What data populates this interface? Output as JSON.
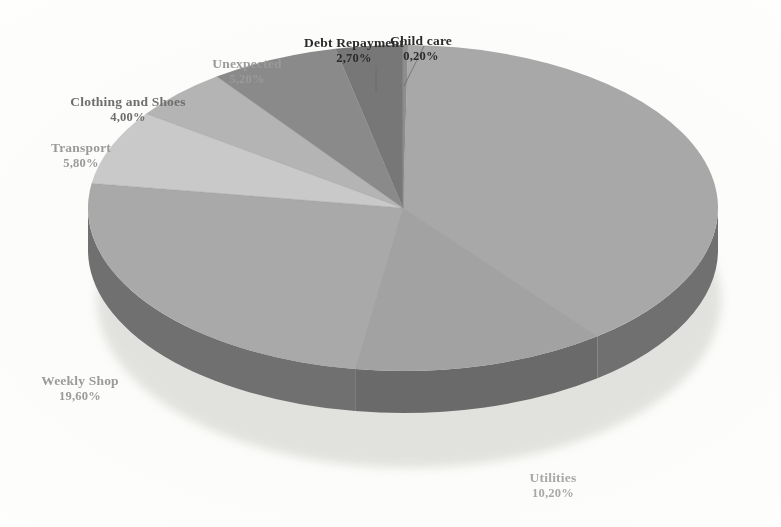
{
  "chart_data": {
    "type": "pie",
    "title": "",
    "subtitle": "",
    "xlabel": "",
    "ylabel": "",
    "legend_position": "none",
    "grid": false,
    "three_d": true,
    "value_suffix": "%",
    "decimal_separator": ",",
    "start_angle_deg": 0,
    "direction": "clockwise",
    "categories": [
      "Child care",
      "Rent",
      "Utilities",
      "Weekly Shop",
      "Transport",
      "Clothing and Shoes",
      "Unexpected",
      "Debt Repayment"
    ],
    "values": [
      0.2,
      30.7,
      10.2,
      19.6,
      5.8,
      4.0,
      5.2,
      2.7
    ],
    "labels": [
      "0,20%",
      "30,70%",
      "10,20%",
      "19,60%",
      "5,80%",
      "4,00%",
      "5,20%",
      "2,70%"
    ],
    "slice_colors": [
      "#8e8e8e",
      "#a8a8a8",
      "#a2a2a2",
      "#a9a9a9",
      "#c9c9c9",
      "#b4b4b4",
      "#8a8a8a",
      "#777777"
    ],
    "slice_side_colors": [
      "#5e5e5e",
      "#6f6f6f",
      "#6a6a6a",
      "#707070",
      "#8a8a8a",
      "#787878",
      "#5c5c5c",
      "#515151"
    ]
  },
  "slices": [
    {
      "name": "Child care",
      "value": 0.2,
      "label": "0,20%",
      "name_text": "Child care",
      "tone": "tone-dark",
      "blur": "blurA",
      "lx": 421,
      "ly": 33,
      "leader": true
    },
    {
      "name": "Rent",
      "value": 30.7,
      "label": "30,70%",
      "name_text": "Rent",
      "tone": "tone-pale",
      "blur": "blurC",
      "lx": 676,
      "ly": 142,
      "leader": false
    },
    {
      "name": "Utilities",
      "value": 10.2,
      "label": "10,20%",
      "name_text": "Utilities",
      "tone": "tone-pale",
      "blur": "blurC",
      "lx": 553,
      "ly": 470,
      "leader": false
    },
    {
      "name": "Weekly Shop",
      "value": 19.6,
      "label": "19,60%",
      "name_text": "Weekly Shop",
      "tone": "tone-light",
      "blur": "blurB",
      "lx": 80,
      "ly": 373,
      "leader": false
    },
    {
      "name": "Transport",
      "value": 5.8,
      "label": "5,80%",
      "name_text": "Transport",
      "tone": "tone-light",
      "blur": "blurC",
      "lx": 81,
      "ly": 140,
      "leader": false
    },
    {
      "name": "Clothing and Shoes",
      "value": 4.0,
      "label": "4,00%",
      "name_text": "Clothing and Shoes",
      "tone": "tone-soft",
      "blur": "blurB",
      "lx": 128,
      "ly": 94,
      "leader": false
    },
    {
      "name": "Unexpected",
      "value": 5.2,
      "label": "5,20%",
      "name_text": "Unexpected",
      "tone": "tone-light",
      "blur": "blurB",
      "lx": 247,
      "ly": 56,
      "leader": false
    },
    {
      "name": "Debt Repayment",
      "value": 2.7,
      "label": "2,70%",
      "name_text": "Debt Repayment",
      "tone": "tone-dark",
      "blur": "blurA",
      "lx": 354,
      "ly": 35,
      "leader": true
    }
  ],
  "geometry": {
    "cx": 403,
    "cy": 208,
    "rx": 315,
    "ry": 163,
    "depth": 42
  },
  "canvas": {
    "width": 781,
    "height": 527,
    "background": "#ffffff"
  }
}
